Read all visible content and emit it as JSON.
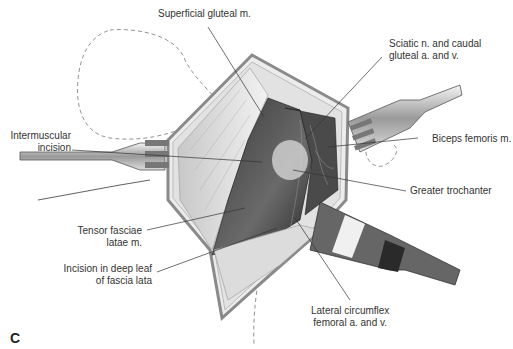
{
  "figure": {
    "panel_letter": "C",
    "labels": {
      "superficial_gluteal": "Superficial gluteal m.",
      "sciatic_line1": "Sciatic n. and caudal",
      "sciatic_line2": "gluteal a. and v.",
      "intermuscular_line1": "Intermuscular",
      "intermuscular_line2": "incision",
      "biceps_femoris": "Biceps femoris m.",
      "greater_trochanter": "Greater trochanter",
      "tensor_line1": "Tensor fasciae",
      "tensor_line2": "latae m.",
      "incision_line1": "Incision in deep leaf",
      "incision_line2": "of fascia lata",
      "lateral_line1": "Lateral circumflex",
      "lateral_line2": "femoral a. and v."
    }
  }
}
